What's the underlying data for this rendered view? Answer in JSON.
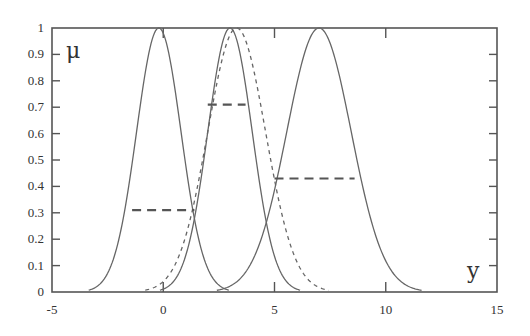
{
  "chart_data": {
    "type": "line",
    "title": "",
    "xlabel": "y",
    "ylabel": "μ",
    "xlim": [
      -5,
      15
    ],
    "ylim": [
      0,
      1
    ],
    "x_ticks": [
      "-5",
      "0",
      "5",
      "10",
      "15"
    ],
    "y_ticks": [
      "0",
      "0.1",
      "0.2",
      "0.3",
      "0.4",
      "0.5",
      "0.6",
      "0.7",
      "0.8",
      "0.9",
      "1"
    ],
    "grid": false,
    "legend": null,
    "series": [
      {
        "name": "membership-1",
        "style": "solid",
        "shape": "gaussian",
        "center": -0.2,
        "sigma": 1.0
      },
      {
        "name": "membership-2",
        "style": "solid",
        "shape": "gaussian",
        "center": 3.0,
        "sigma": 1.0
      },
      {
        "name": "membership-3",
        "style": "dashed",
        "shape": "gaussian",
        "center": 3.3,
        "sigma": 1.3
      },
      {
        "name": "membership-4",
        "style": "solid",
        "shape": "gaussian",
        "center": 7.0,
        "sigma": 1.45
      }
    ],
    "annotations": [
      {
        "type": "dashed-hline",
        "y": 0.31,
        "x_from": -1.4,
        "x_to": 1.4
      },
      {
        "type": "dashed-hline",
        "y": 0.71,
        "x_from": 2.0,
        "x_to": 3.7
      },
      {
        "type": "dashed-hline",
        "y": 0.43,
        "x_from": 5.0,
        "x_to": 8.6
      }
    ]
  },
  "axes": {
    "x_name": "y",
    "y_name": "μ"
  }
}
